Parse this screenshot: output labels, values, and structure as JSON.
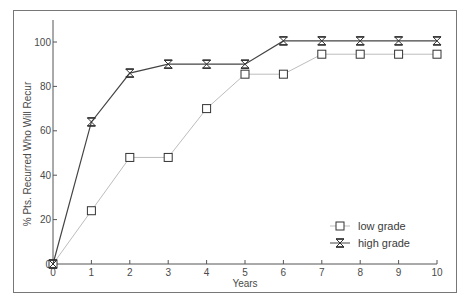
{
  "chart_data": {
    "type": "line",
    "title": "",
    "xlabel": "Years",
    "ylabel": "% Pts. Recurred Who Will Recur",
    "x": [
      0,
      1,
      2,
      3,
      4,
      5,
      6,
      7,
      8,
      9,
      10
    ],
    "xlim": [
      0,
      10
    ],
    "ylim": [
      0,
      110
    ],
    "xticks": [
      "0",
      "1",
      "2",
      "3",
      "4",
      "5",
      "6",
      "7",
      "8",
      "9",
      "10"
    ],
    "yticks": [
      "0",
      "20",
      "40",
      "60",
      "80",
      "100"
    ],
    "grid": false,
    "legend_position": "lower right",
    "series": [
      {
        "name": "low grade",
        "marker": "square",
        "line_color": "#bdbdbd",
        "marker_color": "#333333",
        "values": [
          0,
          24,
          48,
          48,
          70,
          85.5,
          85.5,
          94.5,
          94.5,
          94.5,
          94.5
        ]
      },
      {
        "name": "high grade",
        "marker": "hourglass-x",
        "line_color": "#444444",
        "marker_color": "#333333",
        "values": [
          0,
          64,
          86,
          90,
          90,
          90,
          100.5,
          100.5,
          100.5,
          100.5,
          100.5
        ]
      }
    ]
  },
  "legend": {
    "items": [
      "low grade",
      "high grade"
    ]
  },
  "colors": {
    "frame": "#777777",
    "axis": "#555555",
    "text": "#4a4a4a"
  }
}
